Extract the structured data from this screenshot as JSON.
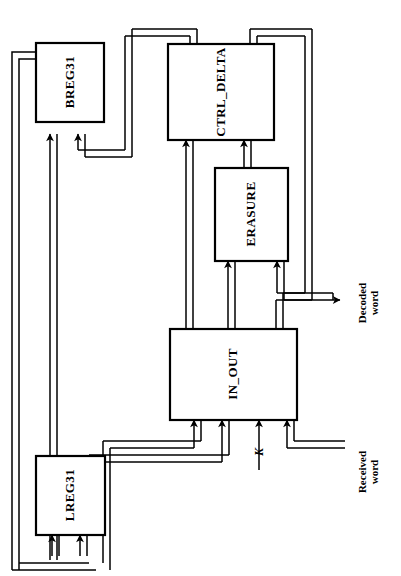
{
  "diagram": {
    "orientation": "rotated-90-ccw",
    "line_color": "#000000",
    "block_fill": "#ffffff",
    "blocks": [
      {
        "id": "breg31",
        "label": "BREG31",
        "x": 36,
        "y": 43,
        "w": 68,
        "h": 79
      },
      {
        "id": "ctrl_delta",
        "label": "CTRL_DELTA",
        "x": 168,
        "y": 44,
        "w": 106,
        "h": 96
      },
      {
        "id": "erasure",
        "label": "ERASURE",
        "x": 215,
        "y": 168,
        "w": 73,
        "h": 93
      },
      {
        "id": "in_out",
        "label": "IN_OUT",
        "x": 170,
        "y": 329,
        "w": 127,
        "h": 91
      },
      {
        "id": "lreg31",
        "label": "LREG31",
        "x": 36,
        "y": 456,
        "w": 69,
        "h": 79
      }
    ],
    "io_labels": [
      {
        "id": "decoded-word",
        "line1": "Decoded",
        "line2": "word",
        "x": 368,
        "y": 303
      },
      {
        "id": "received-word",
        "line1": "Received",
        "line2": "word",
        "x": 368,
        "y": 472
      }
    ],
    "signal_labels": [
      {
        "id": "k-signal",
        "label": "K",
        "x": 259,
        "y": 452
      }
    ]
  }
}
